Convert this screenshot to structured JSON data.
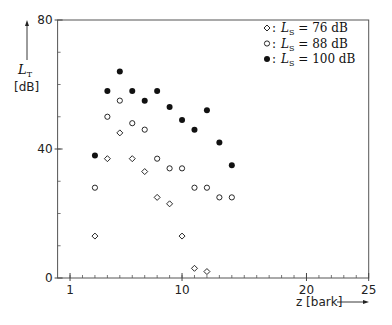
{
  "chart_data": {
    "type": "scatter",
    "title": "",
    "xlabel": "z [bark]",
    "ylabel_main": "L",
    "ylabel_sub": "T",
    "ylabel_unit": "[dB]",
    "xlim": [
      0,
      25
    ],
    "ylim": [
      0,
      80
    ],
    "x_ticks": [
      1,
      10,
      20,
      25
    ],
    "x_tick_labels": [
      "1",
      "10",
      "20",
      "25"
    ],
    "x_minor_step": 1,
    "y_ticks": [
      0,
      40,
      80
    ],
    "y_tick_labels": [
      "0",
      "40",
      "80"
    ],
    "y_minor_step": 10,
    "grid": false,
    "legend_position": "top-right",
    "series": [
      {
        "name": "L_S = 76 dB",
        "legend_marker": "◇:",
        "legend_label_main": "L",
        "legend_label_sub": "S",
        "legend_label_value": "=  76 dB",
        "marker": "diamond-open",
        "x": [
          3,
          4,
          5,
          6,
          7,
          8,
          9,
          10,
          11,
          12
        ],
        "y": [
          13,
          37,
          45,
          37,
          33,
          25,
          23,
          13,
          3,
          2
        ]
      },
      {
        "name": "L_S = 88 dB",
        "legend_marker": "○:",
        "legend_label_main": "L",
        "legend_label_sub": "S",
        "legend_label_value": "=  88 dB",
        "marker": "circle-open",
        "x": [
          3,
          4,
          5,
          6,
          7,
          8,
          9,
          10,
          11,
          12,
          13,
          14
        ],
        "y": [
          28,
          50,
          55,
          48,
          46,
          37,
          34,
          34,
          28,
          28,
          25,
          25
        ]
      },
      {
        "name": "L_S = 100 dB",
        "legend_marker": "●:",
        "legend_label_main": "L",
        "legend_label_sub": "S",
        "legend_label_value": "= 100 dB",
        "marker": "circle-filled",
        "x": [
          3,
          4,
          5,
          6,
          7,
          8,
          9,
          10,
          11,
          12,
          13,
          14
        ],
        "y": [
          38,
          58,
          64,
          58,
          55,
          58,
          53,
          49,
          46,
          52,
          42,
          35
        ]
      }
    ]
  }
}
